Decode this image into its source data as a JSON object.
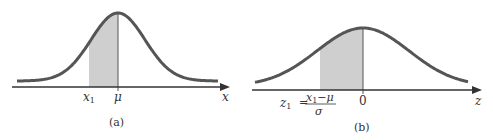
{
  "figure": {
    "type": "normal-distribution-standardization",
    "colors": {
      "curve": "#555555",
      "shade": "#cfcfcf",
      "axis": "#333333"
    },
    "panels": [
      {
        "id": "a",
        "caption": "(a)",
        "axis_label": "x",
        "tick_labels": {
          "left": "x",
          "left_sub": "1",
          "center": "μ"
        },
        "shaded_region": "between x1 and mu"
      },
      {
        "id": "b",
        "caption": "(b)",
        "axis_label": "z",
        "tick_labels": {
          "left_lhs": "z",
          "left_lhs_sub": "1",
          "equals": "=",
          "numerator": "x",
          "numerator_sub": "1",
          "numerator_rest": "−μ",
          "denominator": "σ",
          "center": "0"
        },
        "shaded_region": "between z1 and 0"
      }
    ]
  }
}
